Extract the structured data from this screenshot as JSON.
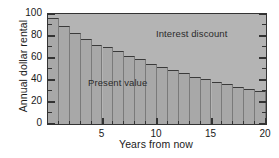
{
  "chart_data": {
    "type": "bar",
    "title": "",
    "xlabel": "Years from now",
    "ylabel": "Annual dollar rental",
    "xlim": [
      0,
      20
    ],
    "ylim": [
      0,
      100
    ],
    "grid": false,
    "legend_position": "in-plot-annotations",
    "x_major_ticks": [
      5,
      10,
      15,
      20
    ],
    "x_major_tick_labels": [
      "5",
      "10",
      "15",
      "20"
    ],
    "x_minor_ticks": [
      1,
      2,
      3,
      4,
      6,
      7,
      8,
      9,
      11,
      12,
      13,
      14,
      16,
      17,
      18,
      19
    ],
    "y_major_ticks": [
      0,
      20,
      40,
      60,
      80,
      100
    ],
    "y_major_tick_labels": [
      "0",
      "20",
      "40",
      "60",
      "80",
      "100"
    ],
    "y_minor_ticks": [
      10,
      30,
      50,
      70,
      90
    ],
    "categories": [
      1,
      2,
      3,
      4,
      5,
      6,
      7,
      8,
      9,
      10,
      11,
      12,
      13,
      14,
      15,
      16,
      17,
      18,
      19,
      20
    ],
    "series": [
      {
        "name": "Present value",
        "values": [
          96,
          89,
          83,
          77,
          72,
          70,
          66,
          62,
          59,
          55,
          52,
          49,
          46,
          43,
          41,
          38,
          36,
          34,
          32,
          30
        ]
      }
    ],
    "annotations": [
      {
        "text": "Interest discount",
        "x": 12.5,
        "y": 86
      },
      {
        "text": "Present value",
        "x": 4.7,
        "y": 42
      }
    ],
    "colors": {
      "plot_background": "#b4b4b4",
      "bar_fill": "#a8a8a8",
      "bar_edge": "#3a3a3a",
      "axis": "#333333",
      "text": "#1a1a1a"
    }
  }
}
